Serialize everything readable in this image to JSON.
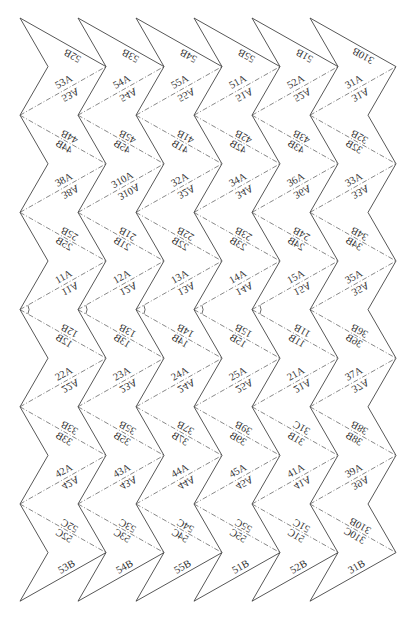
{
  "diagram": {
    "title": "",
    "colors": {
      "line": "#444444",
      "fold": "#555555",
      "text": "#333333",
      "background": "#ffffff"
    },
    "strips": [
      {
        "top": "52B",
        "pairs": [
          [
            "53A",
            "53A"
          ],
          [
            "44B",
            "44B"
          ],
          [
            "38A",
            "38A"
          ],
          [
            "25B",
            "25B"
          ],
          [
            "11A",
            "11A"
          ],
          [
            "12B",
            "12B"
          ],
          [
            "22A",
            "22A"
          ],
          [
            "33B",
            "33B"
          ],
          [
            "42A",
            "42A"
          ],
          [
            "52C",
            "52C"
          ]
        ],
        "bottom": "53B",
        "arc": true
      },
      {
        "top": "53B",
        "pairs": [
          [
            "54A",
            "54A"
          ],
          [
            "45B",
            "45B"
          ],
          [
            "310A",
            "310A"
          ],
          [
            "21B",
            "21B"
          ],
          [
            "12A",
            "12A"
          ],
          [
            "13B",
            "13B"
          ],
          [
            "23A",
            "23A"
          ],
          [
            "35B",
            "35B"
          ],
          [
            "43A",
            "43A"
          ],
          [
            "53C",
            "53C"
          ]
        ],
        "bottom": "54B",
        "arc": true
      },
      {
        "top": "54B",
        "pairs": [
          [
            "55A",
            "55A"
          ],
          [
            "41B",
            "41B"
          ],
          [
            "32A",
            "32A"
          ],
          [
            "22B",
            "22B"
          ],
          [
            "13A",
            "13A"
          ],
          [
            "14B",
            "14B"
          ],
          [
            "24A",
            "24A"
          ],
          [
            "37B",
            "37B"
          ],
          [
            "44A",
            "44A"
          ],
          [
            "54C",
            "54C"
          ]
        ],
        "bottom": "55B",
        "arc": true
      },
      {
        "top": "55B",
        "pairs": [
          [
            "51A",
            "51A"
          ],
          [
            "42B",
            "42B"
          ],
          [
            "34A",
            "34A"
          ],
          [
            "23B",
            "23B"
          ],
          [
            "14A",
            "14A"
          ],
          [
            "15B",
            "15B"
          ],
          [
            "25A",
            "25A"
          ],
          [
            "39B",
            "39B"
          ],
          [
            "45A",
            "45A"
          ],
          [
            "55C",
            "55C"
          ]
        ],
        "bottom": "51B",
        "arc": true
      },
      {
        "top": "51B",
        "pairs": [
          [
            "52A",
            "52A"
          ],
          [
            "43B",
            "43B"
          ],
          [
            "36A",
            "36A"
          ],
          [
            "24B",
            "24B"
          ],
          [
            "15A",
            "15A"
          ],
          [
            "11B",
            "11B"
          ],
          [
            "21A",
            "21A"
          ],
          [
            "31C",
            "31B"
          ],
          [
            "41A",
            "41A"
          ],
          [
            "51C",
            "51C"
          ]
        ],
        "bottom": "52B",
        "arc": true
      },
      {
        "top": "310B",
        "pairs": [
          [
            "31A",
            "31A"
          ],
          [
            "32B",
            "32B"
          ],
          [
            "33A",
            "33A"
          ],
          [
            "34B",
            "34B"
          ],
          [
            "35A",
            "35A"
          ],
          [
            "36B",
            "36B"
          ],
          [
            "37A",
            "37A"
          ],
          [
            "38B",
            "38B"
          ],
          [
            "39A",
            "39A"
          ],
          [
            "310B",
            "310C"
          ]
        ],
        "bottom": "31B",
        "arc": false
      }
    ]
  }
}
